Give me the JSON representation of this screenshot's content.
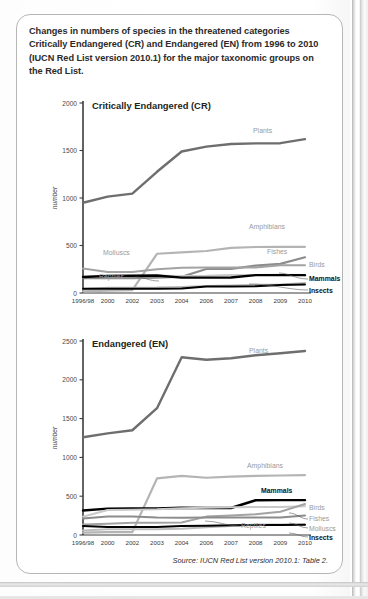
{
  "caption": "Changes in numbers of species in the threatened categories Critically Endangered (CR) and Endangered (EN) from 1996 to 2010 (IUCN Red List version 2010.1) for the major taxonomic groups on the Red List.",
  "source": "Source: IUCN Red List version 2010.1: Table 2.",
  "colors": {
    "black": "#000000",
    "dark_gray": "#5a5a5a",
    "mid_gray": "#8c8c8c",
    "light_gray": "#b4b4b4",
    "pale_gray": "#c9c9c9",
    "axis": "#3c3c3c",
    "label_gray": "#9a9a9a",
    "card_border": "#b6b6b6",
    "text": "#231f20"
  },
  "chart_data": [
    {
      "type": "line",
      "title": "Critically Endangered (CR)",
      "xlabel": "",
      "ylabel": "number",
      "grid": false,
      "legend": "inline-right",
      "x": [
        "1996/98",
        "2000",
        "2002",
        "2003",
        "2004",
        "2006",
        "2007",
        "2008",
        "2009",
        "2010"
      ],
      "ylim": [
        0,
        2000
      ],
      "yticks": [
        0,
        500,
        1000,
        1500,
        2000
      ],
      "series": [
        {
          "name": "Plants",
          "color": "#6e6e6e",
          "width": 2.4,
          "label_x": 2006,
          "values": [
            950,
            1014,
            1046,
            1276,
            1490,
            1541,
            1569,
            1575,
            1577,
            1619
          ]
        },
        {
          "name": "Amphibians",
          "color": "#b4b4b4",
          "width": 2.2,
          "label_x": 2007,
          "values": [
            18,
            25,
            30,
            413,
            427,
            442,
            475,
            484,
            486,
            486
          ]
        },
        {
          "name": "Fishes",
          "color": "#8c8c8c",
          "width": 2.2,
          "label_x": 2008,
          "values": [
            157,
            156,
            157,
            162,
            171,
            253,
            254,
            289,
            306,
            376
          ]
        },
        {
          "name": "Molluscs",
          "color": "#a3a3a3",
          "width": 2.0,
          "label_x": 2000,
          "values": [
            257,
            222,
            222,
            250,
            265,
            268,
            268,
            268,
            291,
            291
          ]
        },
        {
          "name": "Birds",
          "color": "#c9c9c9",
          "width": 2.0,
          "label_x": 2010,
          "values": [
            168,
            182,
            182,
            182,
            179,
            181,
            189,
            190,
            192,
            190
          ]
        },
        {
          "name": "Mammals",
          "color": "#000000",
          "width": 2.4,
          "label_x": 2010,
          "values": [
            169,
            180,
            181,
            184,
            162,
            162,
            163,
            188,
            188,
            188
          ]
        },
        {
          "name": "Reptiles",
          "color": "#bdbdbd",
          "width": 2.0,
          "label_x": 2000,
          "values": [
            41,
            56,
            56,
            57,
            64,
            73,
            79,
            86,
            89,
            106
          ]
        },
        {
          "name": "Insects",
          "color": "#000000",
          "width": 2.0,
          "label_x": 2010,
          "values": [
            44,
            45,
            46,
            46,
            47,
            68,
            68,
            70,
            83,
            89
          ]
        }
      ]
    },
    {
      "type": "line",
      "title": "Endangered (EN)",
      "xlabel": "",
      "ylabel": "number",
      "grid": false,
      "legend": "inline-right",
      "x": [
        "1996/98",
        "2000",
        "2002",
        "2003",
        "2004",
        "2006",
        "2007",
        "2008",
        "2009",
        "2010"
      ],
      "ylim": [
        0,
        2500
      ],
      "yticks": [
        0,
        500,
        1000,
        1500,
        2000,
        2500
      ],
      "series": [
        {
          "name": "Plants",
          "color": "#6e6e6e",
          "width": 2.4,
          "label_x": 2006,
          "values": [
            1260,
            1310,
            1350,
            1634,
            2290,
            2258,
            2278,
            2316,
            2343,
            2371
          ]
        },
        {
          "name": "Amphibians",
          "color": "#b4b4b4",
          "width": 2.2,
          "label_x": 2007,
          "values": [
            31,
            38,
            37,
            729,
            761,
            738,
            753,
            761,
            767,
            772
          ]
        },
        {
          "name": "Mammals",
          "color": "#000000",
          "width": 2.4,
          "label_x": 2008,
          "values": [
            315,
            340,
            343,
            342,
            352,
            348,
            348,
            448,
            450,
            450
          ]
        },
        {
          "name": "Birds",
          "color": "#c9c9c9",
          "width": 2.0,
          "label_x": 2010,
          "values": [
            235,
            321,
            326,
            331,
            345,
            351,
            356,
            361,
            362,
            372
          ]
        },
        {
          "name": "Fishes",
          "color": "#a3a3a3",
          "width": 2.0,
          "label_x": 2010,
          "values": [
            134,
            144,
            157,
            157,
            160,
            237,
            251,
            269,
            300,
            400
          ]
        },
        {
          "name": "Molluscs",
          "color": "#8c8c8c",
          "width": 2.0,
          "label_x": 2010,
          "values": [
            212,
            237,
            237,
            224,
            222,
            224,
            224,
            224,
            224,
            252
          ]
        },
        {
          "name": "Reptiles",
          "color": "#bdbdbd",
          "width": 2.0,
          "label_x": 2007,
          "values": [
            59,
            74,
            74,
            74,
            79,
            101,
            115,
            134,
            134,
            135
          ]
        },
        {
          "name": "Insects",
          "color": "#000000",
          "width": 2.0,
          "label_x": 2010,
          "values": [
            116,
            103,
            103,
            103,
            116,
            118,
            125,
            129,
            130,
            132
          ]
        }
      ]
    }
  ]
}
